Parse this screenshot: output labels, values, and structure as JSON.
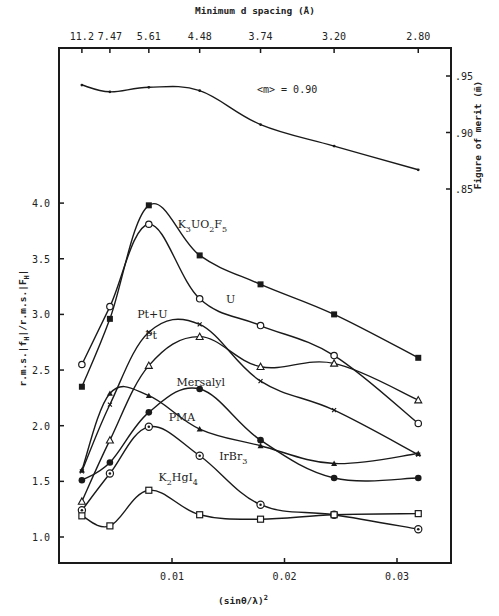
{
  "chart_data": {
    "type": "line",
    "title": "",
    "xlabel": "(sinθ/λ)²",
    "ylabel": "r.m.s.|f_H|/r.m.s.|F_H|",
    "top_axis_label": "Minimum d spacing (Å)",
    "right_axis_label": "Figure of merit (m̄)",
    "xlim": [
      0,
      0.0338
    ],
    "ylim": [
      0.77,
      4.0
    ],
    "right_ylim": [
      0.85,
      0.97
    ],
    "x_ticks": [
      0.01,
      0.02,
      0.03
    ],
    "x_tick_labels": [
      "0.01",
      "0.02",
      "0.03"
    ],
    "y_ticks": [
      1.0,
      1.5,
      2.0,
      2.5,
      3.0,
      3.5,
      4.0
    ],
    "y_tick_labels": [
      "1.0",
      "1.5",
      "2.0",
      "2.5",
      "3.0",
      "3.5",
      "4.0"
    ],
    "right_ticks": [
      0.85,
      0.9,
      0.95
    ],
    "right_tick_labels": [
      ".85",
      ".90",
      ".95"
    ],
    "top_ticks": [
      0.00199,
      0.00448,
      0.00794,
      0.01246,
      0.01787,
      0.02441,
      0.03189
    ],
    "top_tick_labels": [
      "11.2",
      "7.47",
      "5.61",
      "4.48",
      "3.74",
      "3.20",
      "2.80"
    ],
    "x": [
      0.00199,
      0.00448,
      0.00794,
      0.01246,
      0.01787,
      0.02441,
      0.03189
    ],
    "grid": false,
    "legend": "inline labels",
    "annotations": [
      {
        "text": "<m> = 0.90",
        "x": 0.0195,
        "right_y": 0.945
      }
    ],
    "series": [
      {
        "name": "K3UO2F5",
        "label_html": "K3UO2F5",
        "marker": "filled-square",
        "values": [
          2.35,
          2.96,
          3.98,
          3.53,
          3.27,
          3.0,
          2.61
        ],
        "label_pos": [
          0.0105,
          3.78
        ]
      },
      {
        "name": "U",
        "marker": "open-circle",
        "values": [
          2.55,
          3.07,
          3.81,
          3.14,
          2.9,
          2.63,
          2.02
        ],
        "label_pos": [
          0.0148,
          3.1
        ]
      },
      {
        "name": "Pt+U",
        "marker": "cross",
        "values": [
          1.59,
          2.19,
          2.84,
          2.91,
          2.4,
          2.14,
          1.74
        ],
        "label_pos": [
          0.0069,
          2.97
        ]
      },
      {
        "name": "Pt",
        "marker": "open-triangle",
        "values": [
          1.32,
          1.87,
          2.54,
          2.8,
          2.53,
          2.56,
          2.23
        ],
        "label_pos": [
          0.0076,
          2.78
        ]
      },
      {
        "name": "Mersalyl",
        "marker": "filled-circle",
        "values": [
          1.51,
          1.67,
          2.12,
          2.33,
          1.87,
          1.53,
          1.53
        ],
        "label_pos": [
          0.0104,
          2.36
        ]
      },
      {
        "name": "PMA",
        "marker": "filled-triangle",
        "values": [
          1.6,
          2.29,
          2.27,
          1.97,
          1.82,
          1.66,
          1.75
        ],
        "label_pos": [
          0.0097,
          2.04
        ]
      },
      {
        "name": "IrBr3",
        "marker": "dot-circle",
        "values": [
          1.24,
          1.57,
          1.99,
          1.73,
          1.29,
          1.2,
          1.07
        ],
        "label_pos": [
          0.0142,
          1.69
        ]
      },
      {
        "name": "K2HgI4",
        "marker": "open-square",
        "values": [
          1.19,
          1.1,
          1.42,
          1.2,
          1.16,
          1.2,
          1.21
        ],
        "label_pos": [
          0.0088,
          1.5
        ]
      },
      {
        "name": "Figure of merit",
        "axis": "right",
        "marker": "small-dot",
        "values": [
          0.942,
          0.936,
          0.94,
          0.937,
          0.907,
          0.888,
          0.867
        ]
      }
    ]
  },
  "labels": {
    "top_axis_title": "Minimum d spacing (Å)",
    "bottom_axis_title": "(sinθ/λ)",
    "bottom_axis_exp": "2",
    "right_axis_title": "Figure of merit (m̄)",
    "left_axis_title": "r.m.s.|f",
    "left_axis_sub1": "H",
    "left_axis_mid": "|/r.m.s.|F",
    "left_axis_sub2": "H",
    "left_axis_end": "|",
    "merit_annotation": "<m> =  0.90"
  }
}
